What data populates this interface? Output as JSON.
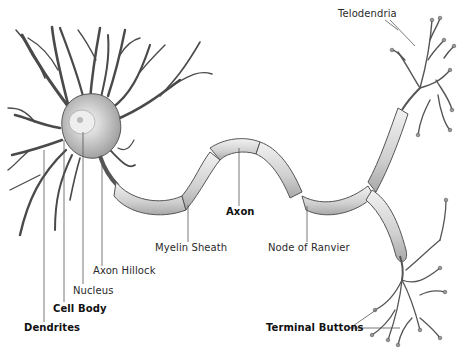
{
  "diagram": {
    "labels": {
      "telodendria": "Telodendria",
      "axon": "Axon",
      "myelin_sheath": "Myelin Sheath",
      "node_of_ranvier": "Node of Ranvier",
      "axon_hillock": "Axon Hillock",
      "nucleus": "Nucleus",
      "cell_body": "Cell Body",
      "dendrites": "Dendrites",
      "terminal_buttons": "Terminal Buttons"
    },
    "colors": {
      "background": "#ffffff",
      "ink": "#3a3a3a",
      "myelin_fill": "#dcdcdc",
      "soma_fill": "#cfcfcf",
      "leader_line": "#555555"
    }
  }
}
